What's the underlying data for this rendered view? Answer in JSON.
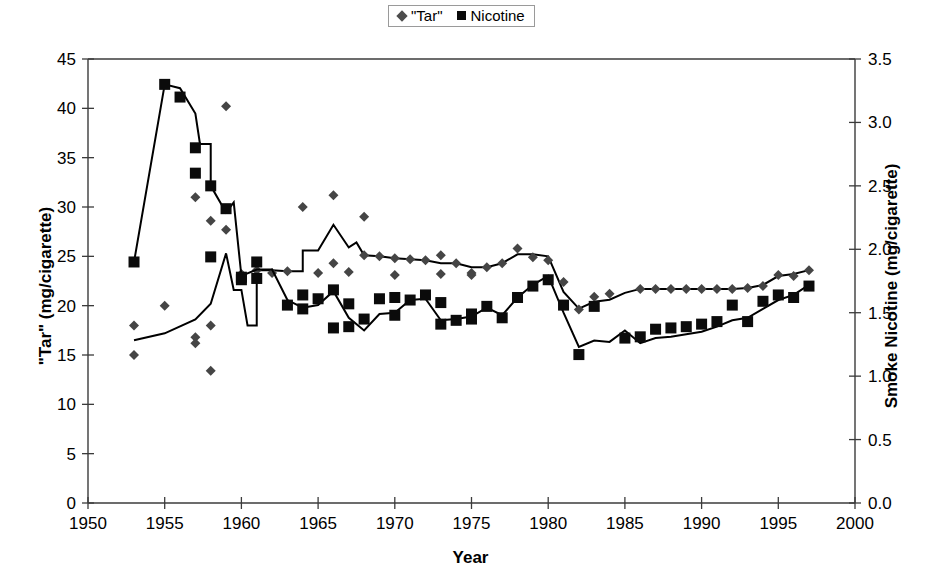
{
  "figure": {
    "width": 941,
    "height": 582,
    "background": "#ffffff",
    "plot_left": 88,
    "plot_right": 855,
    "plot_top": 59,
    "plot_bottom": 503
  },
  "legend": {
    "position": "top-center",
    "border_color": "#9a9a9a",
    "entries": [
      {
        "marker": "diamond-marker",
        "label": "\"Tar\"",
        "color": "#4c4c4c"
      },
      {
        "marker": "square-marker",
        "label": "Nicotine",
        "color": "#0a0a0a"
      }
    ]
  },
  "chart_data": {
    "type": "scatter",
    "title": "",
    "xlabel": "Year",
    "ylabel": "\"Tar\" (mg/cigarette)",
    "y2label": "Smoke Nicotine (mg/cigarette)",
    "xlim": [
      1950,
      2000
    ],
    "ylim": [
      0,
      45
    ],
    "y2lim": [
      0.0,
      3.5
    ],
    "xticks": [
      1950,
      1955,
      1960,
      1965,
      1970,
      1975,
      1980,
      1985,
      1990,
      1995,
      2000
    ],
    "xtick_labels": [
      "1950",
      "1955",
      "1960",
      "1965",
      "1970",
      "1975",
      "1980",
      "1985",
      "1990",
      "1995",
      "2000"
    ],
    "yticks": [
      0,
      5,
      10,
      15,
      20,
      25,
      30,
      35,
      40,
      45
    ],
    "ytick_labels": [
      "0",
      "5",
      "10",
      "15",
      "20",
      "25",
      "30",
      "35",
      "40",
      "45"
    ],
    "y2ticks": [
      0.0,
      0.5,
      1.0,
      1.5,
      2.0,
      2.5,
      3.0,
      3.5
    ],
    "y2tick_labels": [
      "0.0",
      "0.5",
      "1.0",
      "1.5",
      "2.0",
      "2.5",
      "3.0",
      "3.5"
    ],
    "grid": false,
    "series": [
      {
        "name": "\"Tar\"",
        "marker": "diamond",
        "axis": "left",
        "units": "mg/cigarette",
        "points": [
          [
            1953,
            15.0
          ],
          [
            1953,
            18.0
          ],
          [
            1955,
            20.0
          ],
          [
            1957,
            16.8
          ],
          [
            1957,
            16.2
          ],
          [
            1957,
            31.0
          ],
          [
            1958,
            13.4
          ],
          [
            1958,
            18.0
          ],
          [
            1958,
            28.6
          ],
          [
            1959,
            40.2
          ],
          [
            1959,
            27.7
          ],
          [
            1960,
            22.6
          ],
          [
            1960,
            22.9
          ],
          [
            1960,
            23.2
          ],
          [
            1961,
            23.6
          ],
          [
            1962,
            23.3
          ],
          [
            1963,
            23.5
          ],
          [
            1964,
            30.0
          ],
          [
            1965,
            23.3
          ],
          [
            1966,
            31.2
          ],
          [
            1966,
            24.3
          ],
          [
            1967,
            23.4
          ],
          [
            1968,
            29.0
          ],
          [
            1968,
            25.1
          ],
          [
            1969,
            25.0
          ],
          [
            1970,
            24.8
          ],
          [
            1970,
            23.1
          ],
          [
            1971,
            24.7
          ],
          [
            1972,
            24.6
          ],
          [
            1973,
            25.1
          ],
          [
            1973,
            23.2
          ],
          [
            1974,
            24.3
          ],
          [
            1975,
            23.3
          ],
          [
            1975,
            23.1
          ],
          [
            1976,
            23.9
          ],
          [
            1977,
            24.3
          ],
          [
            1978,
            25.8
          ],
          [
            1979,
            24.9
          ],
          [
            1980,
            24.6
          ],
          [
            1981,
            22.4
          ],
          [
            1982,
            19.6
          ],
          [
            1983,
            20.9
          ],
          [
            1984,
            21.2
          ],
          [
            1986,
            21.7
          ],
          [
            1987,
            21.7
          ],
          [
            1988,
            21.7
          ],
          [
            1989,
            21.7
          ],
          [
            1990,
            21.7
          ],
          [
            1991,
            21.7
          ],
          [
            1992,
            21.7
          ],
          [
            1993,
            21.8
          ],
          [
            1994,
            22.0
          ],
          [
            1995,
            23.1
          ],
          [
            1996,
            23.0
          ],
          [
            1997,
            23.6
          ]
        ],
        "line": [
          [
            1953,
            16.5
          ],
          [
            1955,
            17.2
          ],
          [
            1957,
            18.6
          ],
          [
            1958,
            20.2
          ],
          [
            1959,
            25.3
          ],
          [
            1959.5,
            21.6
          ],
          [
            1960,
            21.6
          ],
          [
            1960.4,
            18.0
          ],
          [
            1961,
            18.0
          ],
          [
            1961,
            23.6
          ],
          [
            1962,
            23.6
          ],
          [
            1963,
            23.5
          ],
          [
            1964,
            23.5
          ],
          [
            1964,
            25.6
          ],
          [
            1965,
            25.6
          ],
          [
            1966,
            28.2
          ],
          [
            1967,
            25.9
          ],
          [
            1967.5,
            26.4
          ],
          [
            1968,
            25.1
          ],
          [
            1969,
            25.0
          ],
          [
            1970,
            24.8
          ],
          [
            1971,
            24.7
          ],
          [
            1972,
            24.6
          ],
          [
            1973,
            24.3
          ],
          [
            1974,
            24.3
          ],
          [
            1975,
            23.9
          ],
          [
            1976,
            23.9
          ],
          [
            1977,
            24.3
          ],
          [
            1978,
            25.2
          ],
          [
            1979,
            25.2
          ],
          [
            1980,
            25.0
          ],
          [
            1981,
            21.4
          ],
          [
            1982,
            19.7
          ],
          [
            1983,
            20.4
          ],
          [
            1984,
            20.6
          ],
          [
            1985,
            21.3
          ],
          [
            1986,
            21.7
          ],
          [
            1987,
            21.7
          ],
          [
            1988,
            21.7
          ],
          [
            1989,
            21.7
          ],
          [
            1990,
            21.7
          ],
          [
            1991,
            21.7
          ],
          [
            1992,
            21.7
          ],
          [
            1993,
            21.8
          ],
          [
            1994,
            22.1
          ],
          [
            1995,
            23.0
          ],
          [
            1996,
            23.2
          ],
          [
            1997,
            23.6
          ]
        ]
      },
      {
        "name": "Nicotine",
        "marker": "square",
        "axis": "right",
        "units": "mg/cigarette",
        "note": "values below are plotted on the right axis (mg nicotine); left-axis pixel equivalent = value x (45/3.5)",
        "points": [
          [
            1953,
            1.9
          ],
          [
            1955,
            3.3
          ],
          [
            1956,
            3.2
          ],
          [
            1957,
            2.8
          ],
          [
            1957,
            2.6
          ],
          [
            1958,
            2.5
          ],
          [
            1958,
            1.94
          ],
          [
            1959,
            2.32
          ],
          [
            1960,
            1.78
          ],
          [
            1960,
            1.76
          ],
          [
            1961,
            1.9
          ],
          [
            1961,
            1.77
          ],
          [
            1963,
            1.56
          ],
          [
            1964,
            1.53
          ],
          [
            1964,
            1.64
          ],
          [
            1965,
            1.61
          ],
          [
            1966,
            1.68
          ],
          [
            1966,
            1.38
          ],
          [
            1967,
            1.39
          ],
          [
            1967,
            1.57
          ],
          [
            1968,
            1.45
          ],
          [
            1969,
            1.61
          ],
          [
            1970,
            1.48
          ],
          [
            1970,
            1.62
          ],
          [
            1971,
            1.6
          ],
          [
            1972,
            1.64
          ],
          [
            1973,
            1.58
          ],
          [
            1973,
            1.41
          ],
          [
            1974,
            1.44
          ],
          [
            1975,
            1.45
          ],
          [
            1975,
            1.49
          ],
          [
            1976,
            1.55
          ],
          [
            1977,
            1.46
          ],
          [
            1978,
            1.62
          ],
          [
            1979,
            1.71
          ],
          [
            1980,
            1.76
          ],
          [
            1981,
            1.56
          ],
          [
            1982,
            1.17
          ],
          [
            1983,
            1.55
          ],
          [
            1985,
            1.3
          ],
          [
            1986,
            1.31
          ],
          [
            1987,
            1.37
          ],
          [
            1988,
            1.38
          ],
          [
            1989,
            1.39
          ],
          [
            1990,
            1.41
          ],
          [
            1991,
            1.43
          ],
          [
            1992,
            1.56
          ],
          [
            1993,
            1.43
          ],
          [
            1994,
            1.59
          ],
          [
            1995,
            1.64
          ],
          [
            1996,
            1.62
          ],
          [
            1997,
            1.71
          ]
        ],
        "line": [
          [
            1953,
            1.9
          ],
          [
            1955,
            3.3
          ],
          [
            1956,
            3.27
          ],
          [
            1957,
            3.07
          ],
          [
            1957.3,
            2.83
          ],
          [
            1958,
            2.83
          ],
          [
            1958,
            2.5
          ],
          [
            1959,
            2.29
          ],
          [
            1959.5,
            2.37
          ],
          [
            1960,
            1.79
          ],
          [
            1961,
            1.84
          ],
          [
            1962,
            1.84
          ],
          [
            1963,
            1.6
          ],
          [
            1964,
            1.54
          ],
          [
            1965,
            1.56
          ],
          [
            1966,
            1.67
          ],
          [
            1967,
            1.46
          ],
          [
            1968,
            1.36
          ],
          [
            1969,
            1.49
          ],
          [
            1970,
            1.5
          ],
          [
            1971,
            1.6
          ],
          [
            1972,
            1.61
          ],
          [
            1973,
            1.44
          ],
          [
            1974,
            1.45
          ],
          [
            1975,
            1.47
          ],
          [
            1976,
            1.54
          ],
          [
            1977,
            1.48
          ],
          [
            1978,
            1.62
          ],
          [
            1979,
            1.72
          ],
          [
            1980,
            1.79
          ],
          [
            1981,
            1.5
          ],
          [
            1982,
            1.23
          ],
          [
            1983,
            1.28
          ],
          [
            1984,
            1.27
          ],
          [
            1985,
            1.36
          ],
          [
            1986,
            1.26
          ],
          [
            1987,
            1.3
          ],
          [
            1988,
            1.31
          ],
          [
            1989,
            1.33
          ],
          [
            1990,
            1.35
          ],
          [
            1991,
            1.39
          ],
          [
            1992,
            1.44
          ],
          [
            1993,
            1.46
          ],
          [
            1994,
            1.53
          ],
          [
            1995,
            1.6
          ],
          [
            1996,
            1.64
          ],
          [
            1997,
            1.72
          ]
        ]
      }
    ]
  }
}
